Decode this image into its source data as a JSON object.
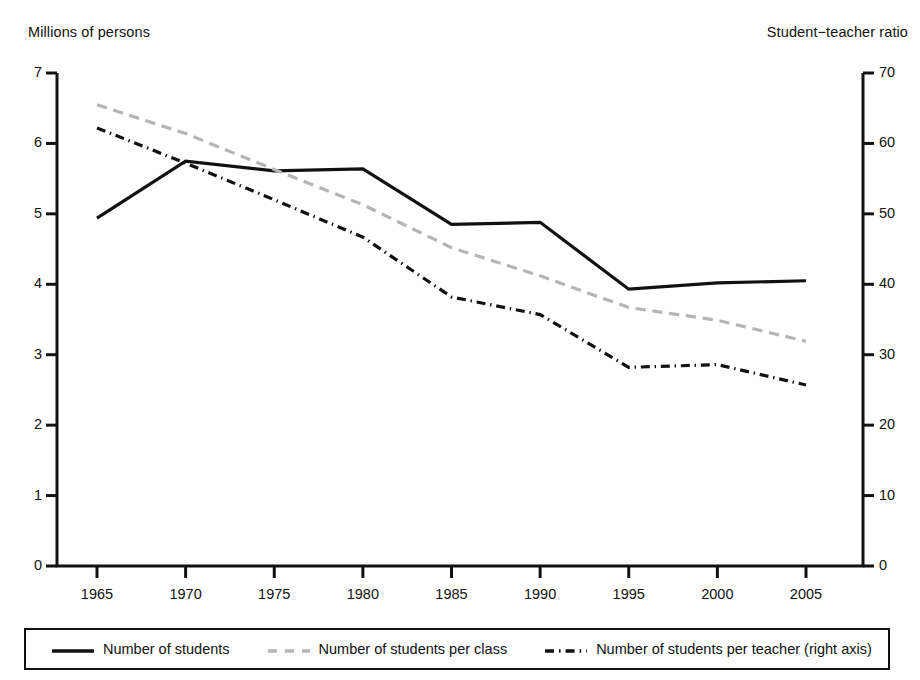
{
  "chart_data": {
    "type": "line",
    "title": "",
    "xlabel": "",
    "ylabel": "Millions of persons",
    "y2label": "Student−teacher ratio",
    "x": [
      1965,
      1970,
      1975,
      1980,
      1985,
      1990,
      1995,
      2000,
      2005
    ],
    "xticklabels": [
      "1965",
      "1970",
      "1975",
      "1980",
      "1985",
      "1990",
      "1995",
      "2000",
      "2005"
    ],
    "yticklabels": [
      "0",
      "1",
      "2",
      "3",
      "4",
      "5",
      "6",
      "7"
    ],
    "y2ticklabels": [
      "0",
      "10",
      "20",
      "30",
      "40",
      "50",
      "60",
      "70"
    ],
    "ylim": [
      0,
      7
    ],
    "y2lim": [
      0,
      70
    ],
    "xlim": [
      1962.5,
      2007.5
    ],
    "grid": false,
    "legend_position": "bottom",
    "series": [
      {
        "name": "Number of students",
        "axis": "left",
        "style": "solid",
        "color": "#111111",
        "width": 3.2,
        "values": [
          4.94,
          5.75,
          5.61,
          5.64,
          4.85,
          4.88,
          3.93,
          4.02,
          4.05
        ]
      },
      {
        "name": "Number of students per class",
        "axis": "left",
        "style": "dashed",
        "color": "#b5b5b5",
        "width": 3.2,
        "values": [
          6.55,
          6.14,
          5.63,
          5.13,
          4.52,
          4.12,
          3.67,
          3.49,
          3.19
        ]
      },
      {
        "name": "Number of students per teacher (right axis)",
        "axis": "right",
        "style": "dashdot",
        "color": "#111111",
        "width": 3.2,
        "values": [
          62.2,
          57.2,
          52.0,
          46.7,
          38.2,
          35.7,
          28.2,
          28.6,
          25.7
        ]
      }
    ]
  },
  "legend": {
    "items": [
      {
        "label": "Number of students",
        "style": "solid",
        "color": "#111111"
      },
      {
        "label": "Number of students per class",
        "style": "dashed",
        "color": "#b5b5b5"
      },
      {
        "label": "Number of students per teacher (right axis)",
        "style": "dashdot",
        "color": "#111111"
      }
    ]
  },
  "axes": {
    "left_title": "Millions of persons",
    "right_title": "Student−teacher ratio"
  }
}
